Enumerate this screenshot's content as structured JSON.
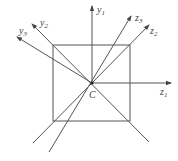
{
  "diagram": {
    "center_label": "C",
    "axes": [
      {
        "id": "y1",
        "label": "y",
        "sub": "1"
      },
      {
        "id": "z1",
        "label": "z",
        "sub": "1"
      },
      {
        "id": "y2",
        "label": "y",
        "sub": "2"
      },
      {
        "id": "y3",
        "label": "y",
        "sub": "3"
      },
      {
        "id": "z2",
        "label": "z",
        "sub": "2"
      },
      {
        "id": "z3",
        "label": "z",
        "sub": "3"
      }
    ],
    "colors": {
      "line": "#555555",
      "text": "#444444"
    }
  }
}
